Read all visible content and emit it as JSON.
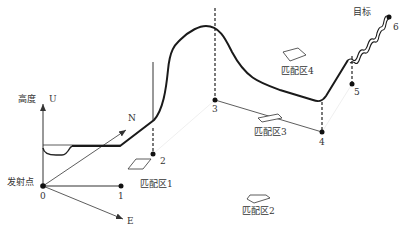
{
  "axes": {
    "up_label": "高度",
    "up_axis": "U",
    "north_axis": "N",
    "east_axis": "E",
    "origin_label": "发射点"
  },
  "target_label": "目标",
  "waypoints": [
    {
      "id": "0"
    },
    {
      "id": "1"
    },
    {
      "id": "2"
    },
    {
      "id": "3"
    },
    {
      "id": "4"
    },
    {
      "id": "5"
    },
    {
      "id": "6"
    }
  ],
  "matching_zones": [
    {
      "label": "匹配区1"
    },
    {
      "label": "匹配区2"
    },
    {
      "label": "匹配区3"
    },
    {
      "label": "匹配区4"
    }
  ],
  "colors": {
    "trajectory": "#1a1a1a",
    "axis": "#333333",
    "dashed": "#222222",
    "text": "#333333"
  }
}
